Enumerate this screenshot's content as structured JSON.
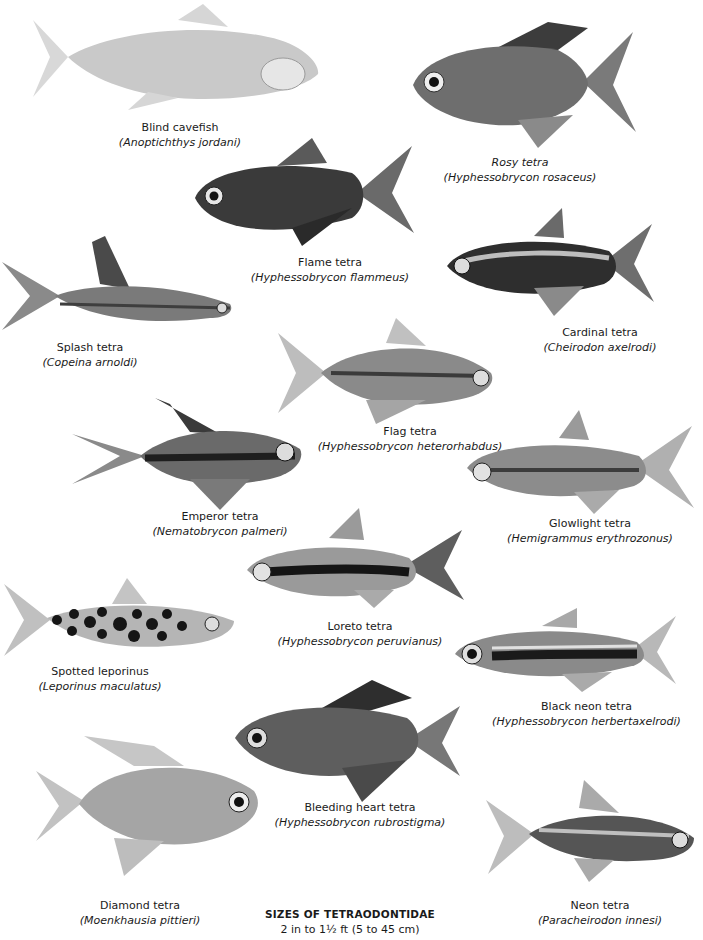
{
  "page": {
    "background": "#ffffff"
  },
  "species": [
    {
      "id": "blind-cavefish",
      "common": "Blind cavefish",
      "scientific": "(Anoptichthys jordani)",
      "tone": "#c9c9c9",
      "stripe": null
    },
    {
      "id": "rosy-tetra",
      "common": "Rosy tetra",
      "scientific": "(Hyphessobrycon rosaceus)",
      "tone": "#6e6e6e",
      "stripe": null
    },
    {
      "id": "flame-tetra",
      "common": "Flame tetra",
      "scientific": "(Hyphessobrycon flammeus)",
      "tone": "#3a3a3a",
      "stripe": null
    },
    {
      "id": "splash-tetra",
      "common": "Splash tetra",
      "scientific": "(Copeina arnoldi)",
      "tone": "#7a7a7a",
      "stripe": null
    },
    {
      "id": "cardinal-tetra",
      "common": "Cardinal tetra",
      "scientific": "(Cheirodon axelrodi)",
      "tone": "#2e2e2e",
      "stripe": "#bdbdbd"
    },
    {
      "id": "flag-tetra",
      "common": "Flag tetra",
      "scientific": "(Hyphessobrycon heterorhabdus)",
      "tone": "#8a8a8a",
      "stripe": "#3a3a3a"
    },
    {
      "id": "emperor-tetra",
      "common": "Emperor tetra",
      "scientific": "(Nematobrycon palmeri)",
      "tone": "#6a6a6a",
      "stripe": "#1e1e1e"
    },
    {
      "id": "glowlight-tetra",
      "common": "Glowlight tetra",
      "scientific": "(Hemigrammus erythrozonus)",
      "tone": "#8c8c8c",
      "stripe": "#3c3c3c"
    },
    {
      "id": "loreto-tetra",
      "common": "Loreto tetra",
      "scientific": "(Hyphessobrycon peruvianus)",
      "tone": "#9a9a9a",
      "stripe": "#151515"
    },
    {
      "id": "spotted-leporinus",
      "common": "Spotted leporinus",
      "scientific": "(Leporinus maculatus)",
      "tone": "#b5b5b5",
      "stripe": null
    },
    {
      "id": "black-neon-tetra",
      "common": "Black neon tetra",
      "scientific": "(Hyphessobrycon herbertaxelrodi)",
      "tone": "#8a8a8a",
      "stripe": "#1a1a1a"
    },
    {
      "id": "bleeding-heart-tetra",
      "common": "Bleeding heart tetra",
      "scientific": "(Hyphessobrycon rubrostigma)",
      "tone": "#5e5e5e",
      "stripe": null
    },
    {
      "id": "diamond-tetra",
      "common": "Diamond tetra",
      "scientific": "(Moenkhausia pittieri)",
      "tone": "#a5a5a5",
      "stripe": null
    },
    {
      "id": "neon-tetra",
      "common": "Neon tetra",
      "scientific": "(Paracheirodon innesi)",
      "tone": "#555555",
      "stripe": "#bfbfbf"
    }
  ],
  "footer": {
    "title": "SIZES OF TETRAODONTIDAE",
    "size_range": "2 in to 1½ ft (5 to 45 cm)"
  }
}
